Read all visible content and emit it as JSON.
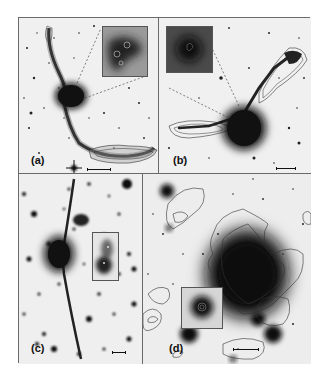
{
  "figure": {
    "panels": [
      {
        "id": "a",
        "label": "(a)",
        "inset": true,
        "scale_bar": true,
        "contours": true
      },
      {
        "id": "b",
        "label": "(b)",
        "inset": true,
        "scale_bar": true,
        "contours": true
      },
      {
        "id": "c",
        "label": "(c)",
        "inset": true,
        "scale_bar": true,
        "contours": false
      },
      {
        "id": "d",
        "label": "(d)",
        "inset": true,
        "scale_bar": true,
        "contours": true
      }
    ]
  },
  "colors": {
    "background": "#f2f2f2",
    "ink": "#111111",
    "border": "#6a6a6a",
    "contour": "#333333"
  }
}
